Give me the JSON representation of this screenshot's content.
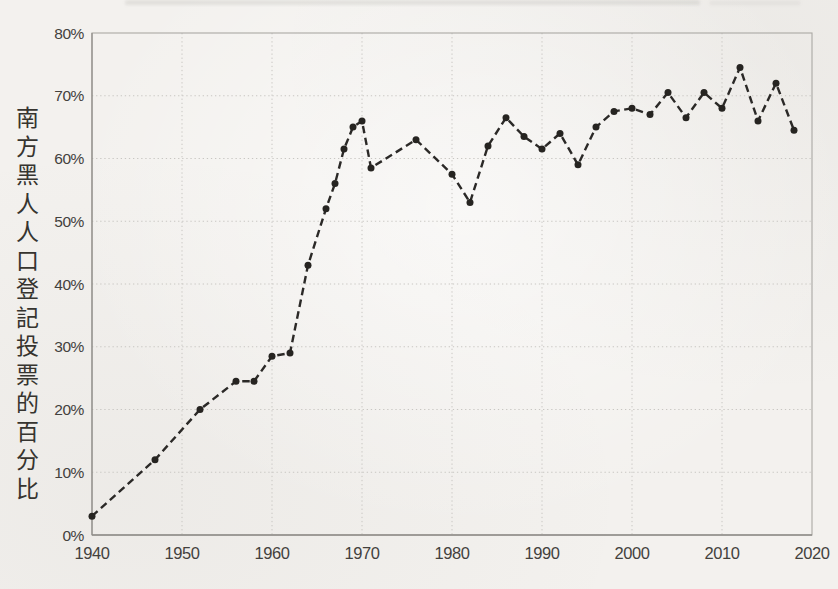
{
  "chart_data": {
    "type": "line",
    "title": "",
    "xlabel": "",
    "ylabel": "南方黑人人口登記投票的百分比",
    "x": [
      1940,
      1947,
      1952,
      1956,
      1958,
      1960,
      1962,
      1964,
      1966,
      1967,
      1968,
      1969,
      1970,
      1971,
      1976,
      1980,
      1982,
      1984,
      1986,
      1988,
      1990,
      1992,
      1994,
      1996,
      1998,
      2000,
      2002,
      2004,
      2006,
      2008,
      2010,
      2012,
      2014,
      2016,
      2018
    ],
    "y": [
      3,
      12,
      20,
      24.5,
      24.5,
      28.5,
      29,
      43,
      52,
      56,
      61.5,
      65,
      66,
      58.5,
      63,
      57.5,
      53,
      62,
      66.5,
      63.5,
      61.5,
      64,
      59,
      65,
      67.5,
      68,
      67,
      70.5,
      66.5,
      70.5,
      68,
      74.5,
      66,
      72,
      64.5
    ],
    "xlim": [
      1940,
      2020
    ],
    "ylim": [
      0,
      80
    ],
    "x_ticks": [
      1940,
      1950,
      1960,
      1970,
      1980,
      1990,
      2000,
      2010,
      2020
    ],
    "y_ticks": [
      0,
      10,
      20,
      30,
      40,
      50,
      60,
      70,
      80
    ],
    "y_tick_labels": [
      "0%",
      "10%",
      "20%",
      "30%",
      "40%",
      "50%",
      "60%",
      "70%",
      "80%"
    ],
    "grid": true,
    "legend": false,
    "line_style": "dashed",
    "marker": "circle"
  },
  "style": {
    "ink": "#2b2927",
    "marker_fill": "#262421",
    "tick_color": "#43413d",
    "grid_color": "#c8c6c2",
    "border_color": "#aaa8a4",
    "axis_color": "#8f8d89",
    "paper": "#f3f1ee"
  }
}
